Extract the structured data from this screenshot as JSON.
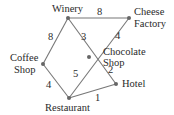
{
  "diagram": {
    "type": "weighted-graph",
    "nodes": [
      {
        "id": "winery",
        "label_lines": [
          "Winery"
        ],
        "x": 68,
        "y": 18
      },
      {
        "id": "cheese",
        "label_lines": [
          "Cheese",
          "Factory"
        ],
        "x": 129,
        "y": 18
      },
      {
        "id": "chocolate",
        "label_lines": [
          "Chocolate",
          "Shop"
        ],
        "x": 89,
        "y": 57
      },
      {
        "id": "coffee",
        "label_lines": [
          "Coffee",
          "Shop"
        ],
        "x": 43,
        "y": 64
      },
      {
        "id": "hotel",
        "label_lines": [
          "Hotel"
        ],
        "x": 116,
        "y": 84
      },
      {
        "id": "restaurant",
        "label_lines": [
          "Restaurant"
        ],
        "x": 69,
        "y": 98
      }
    ],
    "edges": [
      {
        "from": "winery",
        "to": "cheese",
        "weight": "8"
      },
      {
        "from": "winery",
        "to": "coffee",
        "weight": "8"
      },
      {
        "from": "winery",
        "to": "hotel",
        "weight": "3"
      },
      {
        "from": "cheese",
        "to": "restaurant",
        "weight": "4"
      },
      {
        "from": "coffee",
        "to": "restaurant",
        "weight": "4"
      },
      {
        "from": "chocolate",
        "to": "hotel",
        "weight": "2"
      },
      {
        "from": "restaurant",
        "to": "chocolate",
        "weight": "5"
      },
      {
        "from": "restaurant",
        "to": "hotel",
        "weight": "1"
      }
    ],
    "labels": {
      "winery": "Winery",
      "cheese_1": "Cheese",
      "cheese_2": "Factory",
      "chocolate_1": "Chocolate",
      "chocolate_2": "Shop",
      "coffee_1": "Coffee",
      "coffee_2": "Shop",
      "hotel": "Hotel",
      "restaurant": "Restaurant"
    },
    "weights": {
      "winery_cheese": "8",
      "winery_coffee": "8",
      "winery_chocolate": "3",
      "cheese_chocolate": "4",
      "coffee_restaurant": "4",
      "chocolate_hotel": "2",
      "restaurant_chocolate": "5",
      "restaurant_hotel": "1"
    }
  }
}
